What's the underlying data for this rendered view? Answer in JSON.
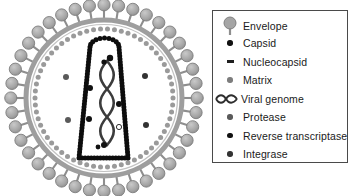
{
  "figure": {
    "background_color": "#ffffff"
  },
  "virion": {
    "name": "hiv-virion-diagram",
    "outer_envelope_color": "#a8a8a8",
    "membrane_color": "#8c8c8c",
    "matrix_color": "#9a9a9a",
    "capsid_color": "#0d0d0d",
    "genome_color": "#3a3a3a",
    "center_x": 104,
    "center_y": 98,
    "outer_radius": 96,
    "spike_count": 40,
    "matrix_bead_count": 62,
    "capsid_shape": "truncated-cone",
    "enzyme_particles": [
      {
        "name": "protease",
        "color": "#5a5a5a",
        "x": 66,
        "y": 77
      },
      {
        "name": "protease",
        "color": "#5a5a5a",
        "x": 68,
        "y": 120
      },
      {
        "name": "reverse-transcriptase",
        "color": "#111111",
        "x": 90,
        "y": 88
      },
      {
        "name": "reverse-transcriptase",
        "color": "#111111",
        "x": 89,
        "y": 119
      },
      {
        "name": "integrase",
        "color": "#333333",
        "x": 145,
        "y": 76
      },
      {
        "name": "integrase",
        "color": "#333333",
        "x": 146,
        "y": 125
      },
      {
        "name": "reverse-transcriptase",
        "color": "#111111",
        "x": 119,
        "y": 104
      },
      {
        "name": "protease",
        "color": "#ffffff",
        "x": 119,
        "y": 127
      }
    ]
  },
  "legend": {
    "name": "component-legend",
    "border_color": "#4a4a4a",
    "items": [
      {
        "icon": "envelope-spike-icon",
        "label": "Envelope",
        "color": "#9c9c9c",
        "shape": "mushroom"
      },
      {
        "icon": "capsid-dot-icon",
        "label": "Capsid",
        "color": "#111111",
        "shape": "dot"
      },
      {
        "icon": "nucleocapsid-dash-icon",
        "label": "Nucleocapsid",
        "color": "#1f1f1f",
        "shape": "dash"
      },
      {
        "icon": "matrix-dot-icon",
        "label": "Matrix",
        "color": "#7d7d7d",
        "shape": "dot"
      },
      {
        "icon": "viral-genome-helix-icon",
        "label": "Viral genome",
        "color": "#2e2e2e",
        "shape": "helix"
      },
      {
        "icon": "protease-dot-icon",
        "label": "Protease",
        "color": "#5a5a5a",
        "shape": "dot"
      },
      {
        "icon": "reverse-transcriptase-dot-icon",
        "label": "Reverse transcriptase",
        "color": "#111111",
        "shape": "dot"
      },
      {
        "icon": "integrase-dot-icon",
        "label": "Integrase",
        "color": "#333333",
        "shape": "dot"
      }
    ]
  }
}
